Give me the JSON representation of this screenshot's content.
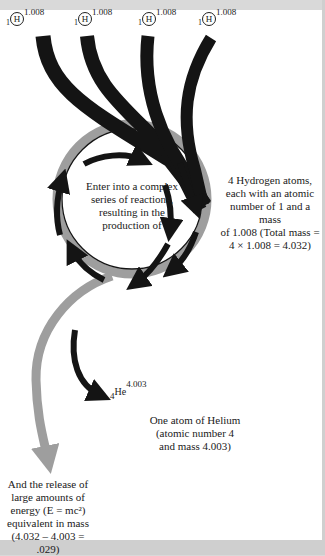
{
  "hydrogen_atoms": [
    {
      "atomic_number": "1",
      "symbol": "H",
      "mass": "1.008"
    },
    {
      "atomic_number": "1",
      "symbol": "H",
      "mass": "1.008"
    },
    {
      "atomic_number": "1",
      "symbol": "H",
      "mass": "1.008"
    },
    {
      "atomic_number": "1",
      "symbol": "H",
      "mass": "1.008"
    }
  ],
  "labels": {
    "reaction_center": [
      "Enter into a complex",
      "series of reactions,",
      "resulting in the",
      "production of"
    ],
    "hydrogen_description": [
      "4 Hydrogen atoms,",
      "each with an atomic",
      "number of 1 and a mass",
      "of 1.008 (Total mass =",
      "4 × 1.008 = 4.032)"
    ],
    "helium_description": [
      "One atom of Helium",
      "(atomic number 4",
      "and mass 4.003)"
    ],
    "energy_description": [
      "And the release of",
      "large amounts of",
      "energy (E = mc²)",
      "equivalent in mass",
      "(4.032 – 4.003 = .029)"
    ]
  },
  "helium": {
    "atomic_number": "4",
    "symbol": "He",
    "mass": "4.003"
  },
  "colors": {
    "arrow_black": "#141414",
    "ring_gray": "#9e9e9e",
    "page": "#ffffff",
    "margin": "#d9d9d9"
  }
}
